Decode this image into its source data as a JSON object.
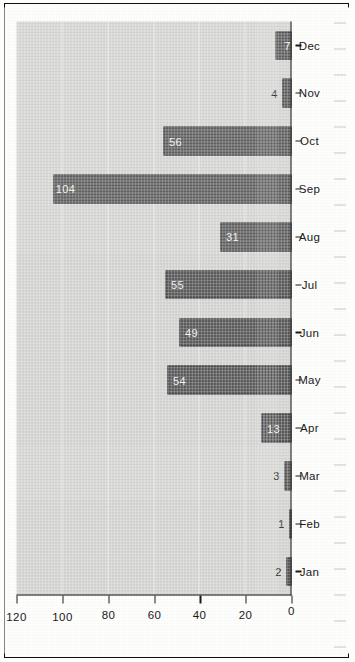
{
  "chart_data": {
    "type": "bar",
    "title": "",
    "subtitle": "",
    "xlabel": "",
    "ylabel": "",
    "categories": [
      "Jan",
      "Feb",
      "Mar",
      "Apr",
      "May",
      "Jun",
      "Jul",
      "Aug",
      "Sep",
      "Oct",
      "Nov",
      "Dec"
    ],
    "values": [
      2,
      1,
      3,
      13,
      54,
      49,
      55,
      31,
      104,
      56,
      4,
      7
    ],
    "data_labels": [
      "2",
      "1",
      "3",
      "13",
      "54",
      "49",
      "55",
      "31",
      "104",
      "56",
      "4",
      "7"
    ],
    "label_placement": [
      "outside",
      "outside",
      "outside",
      "inside",
      "inside",
      "inside",
      "inside",
      "inside",
      "inside",
      "inside",
      "outside",
      "inside"
    ],
    "ylim": [
      0,
      120
    ],
    "yticks": [
      0,
      20,
      40,
      60,
      80,
      100,
      120
    ],
    "ytick_labels": [
      "0",
      "20",
      "40",
      "60",
      "80",
      "100",
      "120"
    ],
    "grid": true,
    "grid_axis": "y",
    "legend": "none",
    "legend_position": "none",
    "orientation": "vertical-rotated-90ccw"
  },
  "style": {
    "bar_fill": "#5a5a5a",
    "bar_stroke": "#3c3c3c",
    "plot_background": "#d4d4d2",
    "page_background": "#fefefd",
    "axis_color": "#1a1a1a",
    "gridline_color": "#fafaf8",
    "value_label_inside_color": "#f2f2f0",
    "value_label_outside_color": "#191919",
    "frame_color": "#0f0f10"
  }
}
